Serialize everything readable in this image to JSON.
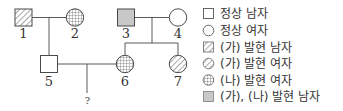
{
  "pedigree": {
    "individuals": [
      {
        "id": "1",
        "label": "1",
        "sex": "male",
        "phenotype": "ga"
      },
      {
        "id": "2",
        "label": "2",
        "sex": "female",
        "phenotype": "na"
      },
      {
        "id": "3",
        "label": "3",
        "sex": "male",
        "phenotype": "ga_na"
      },
      {
        "id": "4",
        "label": "4",
        "sex": "female",
        "phenotype": "normal"
      },
      {
        "id": "5",
        "label": "5",
        "sex": "male",
        "phenotype": "normal"
      },
      {
        "id": "6",
        "label": "6",
        "sex": "female",
        "phenotype": "na"
      },
      {
        "id": "7",
        "label": "7",
        "sex": "female",
        "phenotype": "ga"
      }
    ],
    "unknown_child_label": "?",
    "couples": [
      [
        "1",
        "2"
      ],
      [
        "3",
        "4"
      ],
      [
        "5",
        "6"
      ]
    ],
    "children": {
      "1-2": [
        "5"
      ],
      "3-4": [
        "6",
        "7"
      ],
      "5-6": [
        "?"
      ]
    }
  },
  "legend": {
    "items": [
      {
        "icon": "square-empty",
        "label": "정상 남자"
      },
      {
        "icon": "circle-empty",
        "label": "정상 여자"
      },
      {
        "icon": "square-hatched",
        "label": "(가) 발현 남자"
      },
      {
        "icon": "circle-hatched",
        "label": "(가) 발현 여자"
      },
      {
        "icon": "circle-crosshatched",
        "label": "(나) 발현 여자"
      },
      {
        "icon": "square-grey",
        "label": "(가), (나) 발현 남자"
      }
    ]
  },
  "colors": {
    "line": "#555555",
    "grey_fill": "#c8c8c8",
    "hatch": "#777777",
    "background": "#ffffff"
  }
}
